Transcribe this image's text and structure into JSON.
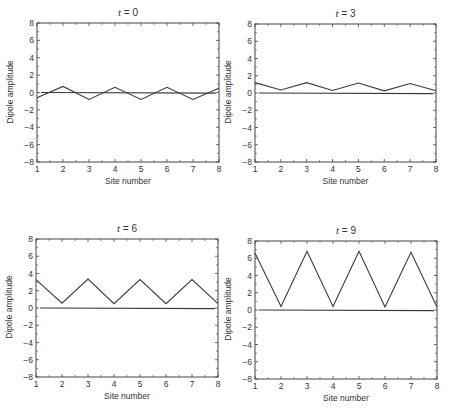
{
  "chart_data": [
    {
      "type": "line",
      "title": "t = 0",
      "title_var": "t",
      "title_value": "= 0",
      "xlabel": "Site number",
      "ylabel": "Dipole amplitude",
      "x": [
        1,
        2,
        3,
        4,
        5,
        6,
        7,
        8
      ],
      "xlim": [
        1,
        8
      ],
      "ylim": [
        -8,
        8
      ],
      "xticks": [
        1,
        2,
        3,
        4,
        5,
        6,
        7,
        8
      ],
      "yticks": [
        -8,
        -6,
        -4,
        -2,
        0,
        2,
        4,
        6,
        8
      ],
      "grid": false,
      "series": [
        {
          "name": "dipole",
          "values": [
            -0.6,
            0.7,
            -0.8,
            0.6,
            -0.8,
            0.6,
            -0.8,
            0.5
          ]
        },
        {
          "name": "zero-line",
          "values": [
            0,
            0,
            0,
            0,
            0,
            0,
            0,
            0
          ]
        }
      ]
    },
    {
      "type": "line",
      "title": "t = 3",
      "title_var": "t",
      "title_value": "= 3",
      "xlabel": "Site number",
      "ylabel": "Dipole amplitude",
      "x": [
        1,
        2,
        3,
        4,
        5,
        6,
        7,
        8
      ],
      "xlim": [
        1,
        8
      ],
      "ylim": [
        -8,
        8
      ],
      "xticks": [
        1,
        2,
        3,
        4,
        5,
        6,
        7,
        8
      ],
      "yticks": [
        -8,
        -6,
        -4,
        -2,
        0,
        2,
        4,
        6,
        8
      ],
      "grid": false,
      "series": [
        {
          "name": "dipole",
          "values": [
            1.2,
            0.35,
            1.2,
            0.3,
            1.15,
            0.25,
            1.1,
            0.25
          ]
        },
        {
          "name": "zero-line",
          "values": [
            0,
            0,
            0,
            0,
            0,
            0,
            0,
            0
          ]
        }
      ]
    },
    {
      "type": "line",
      "title": "t = 6",
      "title_var": "t",
      "title_value": "= 6",
      "xlabel": "Site number",
      "ylabel": "Dipole amplitude",
      "x": [
        1,
        2,
        3,
        4,
        5,
        6,
        7,
        8
      ],
      "xlim": [
        1,
        8
      ],
      "ylim": [
        -8,
        8
      ],
      "xticks": [
        1,
        2,
        3,
        4,
        5,
        6,
        7,
        8
      ],
      "yticks": [
        -8,
        -6,
        -4,
        -2,
        0,
        2,
        4,
        6,
        8
      ],
      "grid": false,
      "series": [
        {
          "name": "dipole",
          "values": [
            3.3,
            0.55,
            3.35,
            0.5,
            3.3,
            0.5,
            3.3,
            0.5
          ]
        },
        {
          "name": "zero-line",
          "values": [
            0,
            0,
            0,
            0,
            0,
            0,
            0,
            0
          ]
        }
      ]
    },
    {
      "type": "line",
      "title": "t = 9",
      "title_var": "t",
      "title_value": "= 9",
      "xlabel": "Site number",
      "ylabel": "Dipole amplitude",
      "x": [
        1,
        2,
        3,
        4,
        5,
        6,
        7,
        8
      ],
      "xlim": [
        1,
        8
      ],
      "ylim": [
        -8,
        8
      ],
      "xticks": [
        1,
        2,
        3,
        4,
        5,
        6,
        7,
        8
      ],
      "yticks": [
        -8,
        -6,
        -4,
        -2,
        0,
        2,
        4,
        6,
        8
      ],
      "grid": false,
      "series": [
        {
          "name": "dipole",
          "values": [
            6.6,
            0.4,
            6.8,
            0.4,
            6.8,
            0.35,
            6.7,
            0.35
          ]
        },
        {
          "name": "zero-line",
          "values": [
            0,
            0,
            0,
            0,
            0,
            0,
            0,
            0
          ]
        }
      ]
    }
  ],
  "colors": {
    "line": "#3a3a3a",
    "axis": "#444444",
    "text": "#333333",
    "background": "#ffffff"
  }
}
